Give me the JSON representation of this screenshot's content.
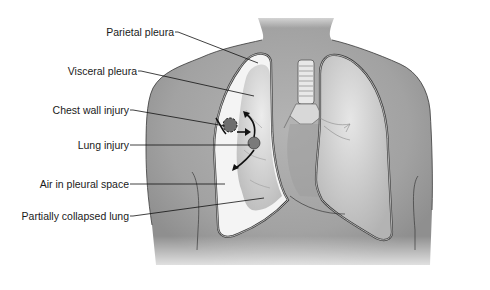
{
  "diagram": {
    "labels": [
      {
        "id": "parietal-pleura",
        "text": "Parietal pleura"
      },
      {
        "id": "visceral-pleura",
        "text": "Visceral pleura"
      },
      {
        "id": "chest-wall-injury",
        "text": "Chest wall injury"
      },
      {
        "id": "lung-injury",
        "text": "Lung injury"
      },
      {
        "id": "air-in-pleural-space",
        "text": "Air in pleural space"
      },
      {
        "id": "partially-collapsed-lung",
        "text": "Partially collapsed lung"
      }
    ],
    "colors": {
      "torso": "#a9a9a9",
      "torso_dark": "#8e8e8e",
      "outline": "#3a3a3a",
      "lung": "#dcdcdc",
      "pleural_air": "#f6f6f6",
      "leader_line": "#111111",
      "label_text": "#1a1a1a"
    }
  }
}
